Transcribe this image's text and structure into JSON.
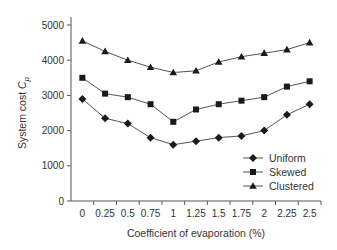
{
  "chart_data": {
    "type": "line",
    "title": "",
    "xlabel": "Coefficient of evaporation (%)",
    "ylabel": "System cost C_p",
    "ylabel_parts": {
      "text": "System cost ",
      "symbol": "C",
      "subscript": "p"
    },
    "categories": [
      "0",
      "0.25",
      "0.5",
      "0.75",
      "1",
      "1.25",
      "1.5",
      "1.75",
      "2",
      "2.25",
      "2.5"
    ],
    "ylim": [
      0,
      5000
    ],
    "yticks": [
      0,
      1000,
      2000,
      3000,
      4000,
      5000
    ],
    "grid": false,
    "legend_position": "lower right",
    "series": [
      {
        "name": "Uniform",
        "marker": "diamond",
        "values": [
          2900,
          2350,
          2200,
          1800,
          1600,
          1700,
          1800,
          1850,
          2000,
          2450,
          2750
        ]
      },
      {
        "name": "Skewed",
        "marker": "square",
        "values": [
          3500,
          3050,
          2950,
          2750,
          2250,
          2600,
          2750,
          2850,
          2950,
          3250,
          3400
        ]
      },
      {
        "name": "Clustered",
        "marker": "triangle",
        "values": [
          4550,
          4250,
          4000,
          3800,
          3650,
          3700,
          3950,
          4100,
          4200,
          4300,
          4500
        ]
      }
    ]
  },
  "colors": {
    "line": "#555555",
    "marker": "#1a1a1a",
    "axis": "#555555",
    "text": "#333333"
  }
}
